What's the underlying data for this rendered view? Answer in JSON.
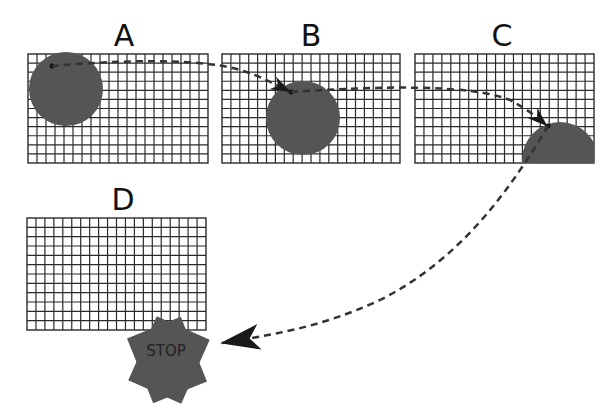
{
  "diagram": {
    "panels": [
      {
        "id": "A",
        "label": "A",
        "x": 28,
        "y": 54,
        "w": 180,
        "h": 109,
        "cols": 20,
        "rows": 12,
        "ball": {
          "cx": 66,
          "cy": 89,
          "r": 37
        }
      },
      {
        "id": "B",
        "label": "B",
        "x": 222,
        "y": 54,
        "w": 178,
        "h": 109,
        "cols": 20,
        "rows": 12,
        "ball": {
          "cx": 303,
          "cy": 118,
          "r": 37
        }
      },
      {
        "id": "C",
        "label": "C",
        "x": 415,
        "y": 54,
        "w": 179,
        "h": 109,
        "cols": 20,
        "rows": 12,
        "ball": {
          "cx": 560,
          "cy": 160,
          "r": 38
        }
      },
      {
        "id": "D",
        "label": "D",
        "x": 27,
        "y": 218,
        "w": 179,
        "h": 112,
        "cols": 20,
        "rows": 12,
        "ball": null
      }
    ],
    "stop_sign": {
      "text": "STOP",
      "cx": 168,
      "cy": 350,
      "color": "#555555"
    },
    "trajectory": {
      "color": "#333333",
      "style": "dashed",
      "segments": [
        "A->B",
        "B->C",
        "C->stop"
      ]
    },
    "colors": {
      "grid": "#2a2a2a",
      "ball": "#555555",
      "background": "#ffffff"
    }
  }
}
